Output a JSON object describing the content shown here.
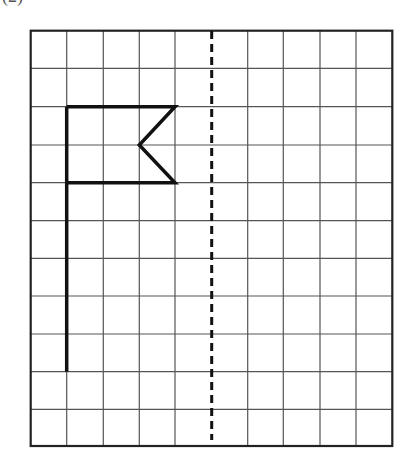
{
  "figure": {
    "label": "(2)",
    "grid": {
      "columns": 10,
      "rows": 11,
      "x_lines": [
        30.7,
        66.7,
        103.3,
        139.3,
        175,
        211.7,
        247.7,
        283.3,
        320,
        356,
        392.3
      ],
      "y_lines": [
        30.7,
        68.3,
        106.7,
        145,
        182.7,
        220.7,
        258.3,
        296,
        334,
        371.7,
        409.3,
        446
      ],
      "line_color": "#555555",
      "border_color": "#222222"
    },
    "symmetry_axis": {
      "x": 211.7,
      "y_start": 31,
      "y_end": 440,
      "style": "dashed",
      "color": "#111111"
    },
    "flag_shape": {
      "description": "Flag with a pole and a notched (swallowtail) banner, drawn on the left half of the grid",
      "pole": {
        "x": 66.7,
        "y_top": 106.7,
        "y_bottom": 371.7
      },
      "banner_points": [
        [
          66.7,
          106.7
        ],
        [
          175,
          106.7
        ],
        [
          139.3,
          145
        ],
        [
          175,
          182.7
        ],
        [
          66.7,
          182.7
        ]
      ],
      "color": "#111111"
    }
  }
}
